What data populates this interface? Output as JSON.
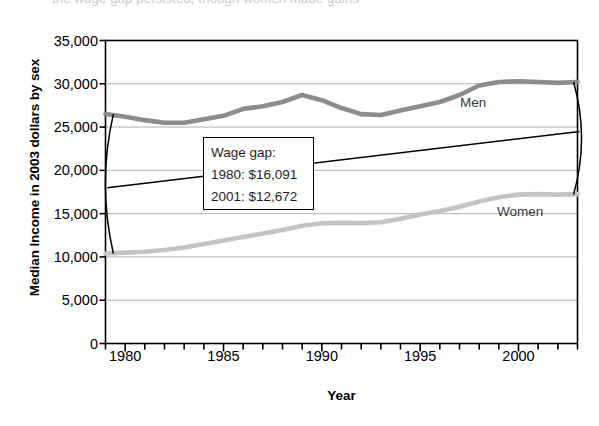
{
  "caption_fragment": "the wage gap persisted, though women made gains",
  "axes": {
    "y_title": "Median Income in 2003 dollars by sex",
    "x_title": "Year",
    "y_ticks": [
      "0",
      "5,000",
      "10,000",
      "15,000",
      "20,000",
      "25,000",
      "30,000",
      "35,000"
    ],
    "x_ticks": [
      "1980",
      "1985",
      "1990",
      "1995",
      "2000"
    ]
  },
  "series_labels": {
    "men": "Men",
    "women": "Women"
  },
  "callout": {
    "title": "Wage gap:",
    "row_1980": "1980: $16,091",
    "row_2001": "2001: $12,672"
  },
  "colors": {
    "men_line": "#8c8c8c",
    "women_line": "#c4c4c4",
    "frame": "#000000",
    "gridline": "#b3b3b3",
    "annotation": "#000000",
    "background": "#ffffff"
  },
  "chart_data": {
    "type": "line",
    "title": "",
    "xlabel": "Year",
    "ylabel": "Median Income in 2003 dollars by sex",
    "xlim": [
      1979,
      2003
    ],
    "ylim": [
      0,
      35000
    ],
    "ytick_step": 5000,
    "grid": "horizontal",
    "legend": "direct-labels",
    "x": [
      1979,
      1980,
      1981,
      1982,
      1983,
      1984,
      1985,
      1986,
      1987,
      1988,
      1989,
      1990,
      1991,
      1992,
      1993,
      1994,
      1995,
      1996,
      1997,
      1998,
      1999,
      2000,
      2001,
      2002,
      2003
    ],
    "series": [
      {
        "name": "Men",
        "color": "#8c8c8c",
        "values": [
          26500,
          26200,
          25800,
          25500,
          25500,
          25900,
          26300,
          27100,
          27400,
          27900,
          28700,
          28100,
          27200,
          26500,
          26400,
          26900,
          27400,
          27900,
          28700,
          29800,
          30200,
          30300,
          30200,
          30100,
          30200
        ]
      },
      {
        "name": "Women",
        "color": "#c4c4c4",
        "values": [
          10400,
          10500,
          10600,
          10800,
          11100,
          11500,
          11900,
          12300,
          12700,
          13100,
          13600,
          13900,
          13950,
          13900,
          14000,
          14400,
          14900,
          15300,
          15800,
          16400,
          16900,
          17200,
          17250,
          17200,
          17250
        ]
      }
    ],
    "annotations": [
      {
        "type": "brace",
        "at_x": 1979.4,
        "y_top": 26500,
        "y_bottom": 10400,
        "label": "1980 wage gap: $16,091"
      },
      {
        "type": "brace",
        "at_x": 2002.8,
        "y_top": 30200,
        "y_bottom": 17200,
        "label": "2001 wage gap: $12,672"
      },
      {
        "type": "connector-line",
        "from": [
          1979.4,
          18000
        ],
        "to": [
          2002.8,
          24500
        ]
      },
      {
        "type": "text-box",
        "lines": [
          "Wage gap:",
          "1980: $16,091",
          "2001: $12,672"
        ]
      },
      {
        "type": "series-label",
        "text": "Men",
        "x": 1997,
        "y": 28600
      },
      {
        "type": "series-label",
        "text": "Women",
        "x": 1999,
        "y": 15700
      }
    ]
  }
}
